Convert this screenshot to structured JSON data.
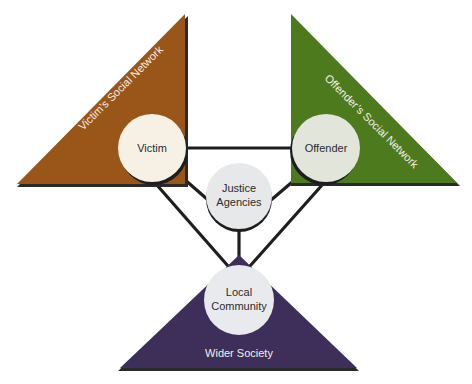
{
  "diagram": {
    "type": "restorative-justice-stakeholder-diagram",
    "colors": {
      "victim_network": "#9a5518",
      "offender_network": "#4e7a1e",
      "wider_society": "#3d2e5a",
      "victim_circle": "#f6f1e4",
      "offender_circle": "#e2e6da",
      "justice_circle": "#e6e8e9",
      "community_circle": "#e9eaed",
      "connector": "#1e1e1e",
      "shadow": "#2a2a2a"
    },
    "regions": {
      "victim_network": "Victim’s Social Network",
      "offender_network": "Offender’s Social Network",
      "wider_society": "Wider Society"
    },
    "nodes": {
      "victim": {
        "line1": "Victim"
      },
      "offender": {
        "line1": "Offender"
      },
      "justice": {
        "line1": "Justice",
        "line2": "Agencies"
      },
      "community": {
        "line1": "Local",
        "line2": "Community"
      }
    },
    "connections": [
      [
        "victim",
        "offender"
      ],
      [
        "victim",
        "justice"
      ],
      [
        "offender",
        "justice"
      ],
      [
        "justice",
        "community"
      ],
      [
        "victim",
        "community"
      ],
      [
        "offender",
        "community"
      ]
    ]
  }
}
